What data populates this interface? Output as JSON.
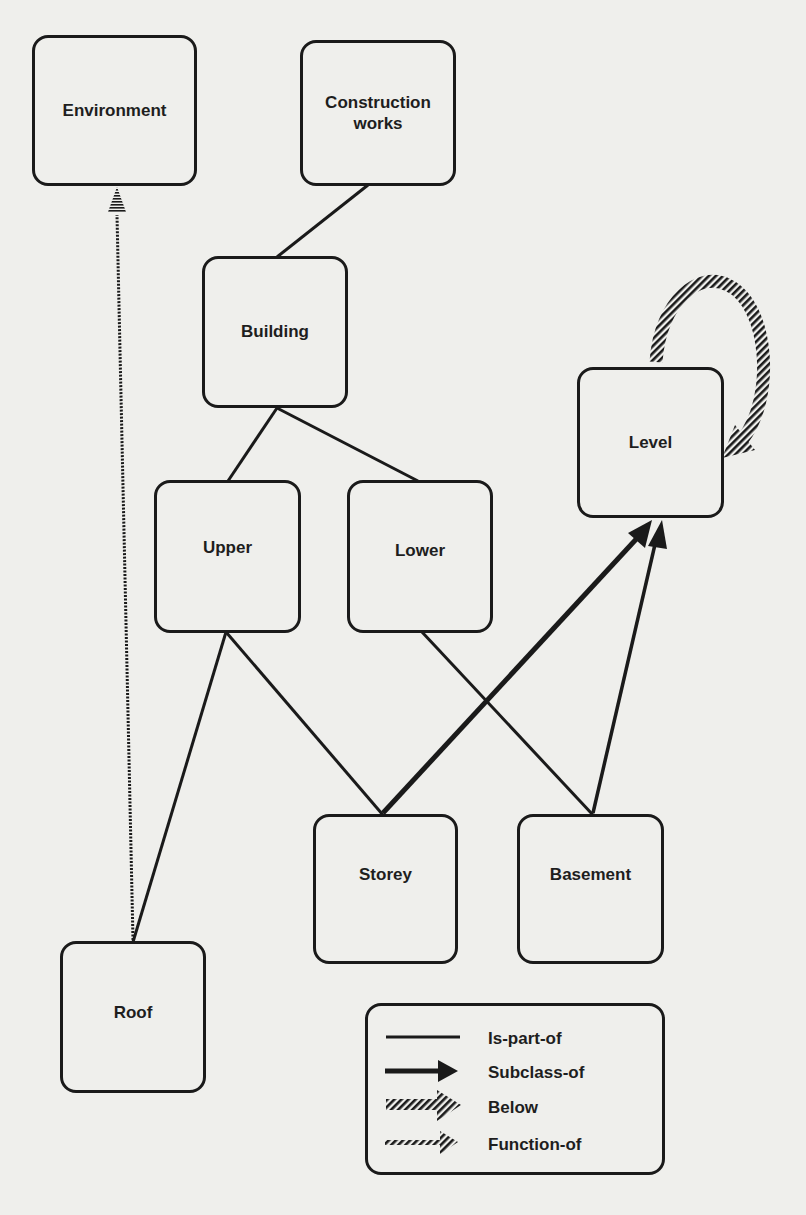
{
  "diagram": {
    "type": "semantic-network",
    "nodes": {
      "environment": {
        "label": "Environment"
      },
      "construction_works": {
        "label": "Construction\nworks"
      },
      "building": {
        "label": "Building"
      },
      "level": {
        "label": "Level"
      },
      "upper": {
        "label": "Upper"
      },
      "lower": {
        "label": "Lower"
      },
      "storey": {
        "label": "Storey"
      },
      "basement": {
        "label": "Basement"
      },
      "roof": {
        "label": "Roof"
      }
    },
    "edges": [
      {
        "from": "Building",
        "to": "Construction works",
        "relation": "Is-part-of"
      },
      {
        "from": "Upper",
        "to": "Building",
        "relation": "Is-part-of"
      },
      {
        "from": "Lower",
        "to": "Building",
        "relation": "Is-part-of"
      },
      {
        "from": "Storey",
        "to": "Upper",
        "relation": "Is-part-of"
      },
      {
        "from": "Roof",
        "to": "Upper",
        "relation": "Is-part-of"
      },
      {
        "from": "Basement",
        "to": "Lower",
        "relation": "Is-part-of"
      },
      {
        "from": "Storey",
        "to": "Level",
        "relation": "Subclass-of"
      },
      {
        "from": "Basement",
        "to": "Level",
        "relation": "Subclass-of"
      },
      {
        "from": "Level",
        "to": "Level",
        "relation": "Below"
      },
      {
        "from": "Roof",
        "to": "Environment",
        "relation": "Function-of"
      }
    ],
    "legend": {
      "items": [
        {
          "label": "Is-part-of",
          "style": "thin-line"
        },
        {
          "label": "Subclass-of",
          "style": "thick-arrow"
        },
        {
          "label": "Below",
          "style": "hatched-thick-arrow"
        },
        {
          "label": "Function-of",
          "style": "hatched-thin-arrow"
        }
      ]
    },
    "colors": {
      "ink": "#1a1a1a",
      "paper": "#efefec"
    }
  }
}
